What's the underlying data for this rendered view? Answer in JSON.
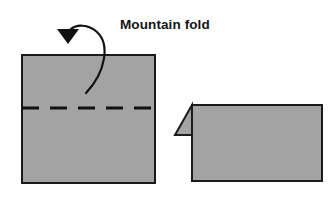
{
  "diagram": {
    "title": "Mountain fold",
    "type": "origami-fold-instruction",
    "caption_label": "Mountain fold",
    "colors": {
      "paper_fill": "#a3a3a3",
      "paper_stroke": "#1a1a1a",
      "fold_line": "#111111",
      "arrow": "#111111",
      "text": "#151515",
      "background": "#ffffff"
    },
    "shapes": {
      "before": {
        "name": "unfolded-square-sheet",
        "x": 22,
        "y": 55,
        "width": 133,
        "height": 128,
        "fold_line_y": 108,
        "fold_line_style": "dashed",
        "fold_dash_pattern": "17 11"
      },
      "after": {
        "name": "folded-sheet",
        "x": 192,
        "y": 105,
        "width": 130,
        "height": 76,
        "flap": {
          "name": "folded-flap-triangle",
          "points": "192,105 175,135 192,135"
        }
      }
    },
    "arrow": {
      "name": "fold-direction-arrow",
      "path": "M 86,93 C 106,72 110,44 97,32 C 88,24 76,24 70,30",
      "head": {
        "points": "57,29 79,29 68,44",
        "direction": "down"
      }
    }
  }
}
